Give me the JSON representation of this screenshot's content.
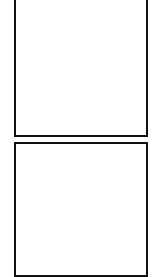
{
  "figure": {
    "width": 159,
    "height": 273,
    "colors": {
      "ink": "#111111",
      "background": "#ffffff"
    },
    "panels": [
      {
        "id": "top",
        "description": "Wavy parallel strands with large black nodes and small dotted clusters attached",
        "bands": [
          {
            "offset_y": 0
          },
          {
            "offset_y": 45
          },
          {
            "offset_y": 90
          }
        ],
        "band_nodes": [
          {
            "x": 34,
            "y": 24,
            "r": 3.5
          },
          {
            "x": 49,
            "y": 30,
            "r": 5.5
          },
          {
            "x": 74,
            "y": 33,
            "r": 6.5
          },
          {
            "x": 89,
            "y": 10,
            "r": 6.5
          },
          {
            "x": 114,
            "y": 7,
            "r": 5.5
          },
          {
            "x": 129,
            "y": 3,
            "r": 3.5
          }
        ]
      },
      {
        "id": "bottom",
        "description": "Scattered diamond-shaped dotted clusters",
        "diamonds": [
          {
            "cx": 70,
            "cy": 160,
            "r": 13
          },
          {
            "cx": 94,
            "cy": 160,
            "r": 13
          },
          {
            "cx": 34,
            "cy": 178,
            "r": 13
          },
          {
            "cx": 57,
            "cy": 188,
            "r": 13
          },
          {
            "cx": 92,
            "cy": 195,
            "r": 13
          },
          {
            "cx": 127,
            "cy": 190,
            "r": 13
          },
          {
            "cx": 50,
            "cy": 213,
            "r": 13
          },
          {
            "cx": 34,
            "cy": 232,
            "r": 13
          },
          {
            "cx": 107,
            "cy": 245,
            "r": 13
          },
          {
            "cx": 69,
            "cy": 262,
            "r": 13
          }
        ],
        "linker": {
          "x": 82,
          "y": 160,
          "w": 5,
          "h": 7
        }
      }
    ]
  }
}
